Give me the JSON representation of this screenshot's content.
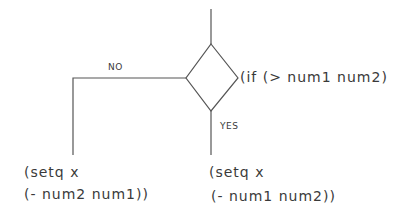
{
  "diagram": {
    "condition": "(if (> num1 num2)",
    "branches": {
      "no": {
        "label": "NO",
        "action_line1": "(setq x",
        "action_line2": "(- num2 num1))"
      },
      "yes": {
        "label": "YES",
        "action_line1": "(setq x",
        "action_line2": "(- num1 num2))"
      }
    },
    "colors": {
      "stroke": "#555555",
      "text": "#3a3a3a"
    }
  }
}
